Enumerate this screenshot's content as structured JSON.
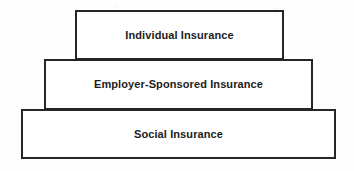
{
  "diagram": {
    "type": "layered-pyramid",
    "background_color": "#ffffff",
    "border_color": "#262626",
    "text_color": "#1c1c1c",
    "tiers": [
      {
        "id": "individual",
        "label": "Individual Insurance",
        "level": 1,
        "position": "top"
      },
      {
        "id": "employer",
        "label": "Employer-Sponsored Insurance",
        "level": 2,
        "position": "middle"
      },
      {
        "id": "social",
        "label": "Social Insurance",
        "level": 3,
        "position": "bottom"
      }
    ]
  }
}
